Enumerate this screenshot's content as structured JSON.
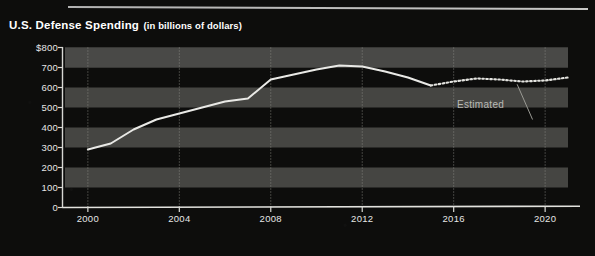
{
  "header": {
    "title_main": "U.S. Defense Spending",
    "title_sub": "(in billions of dollars)"
  },
  "annotations": {
    "estimated_label": "Estimated"
  },
  "colors": {
    "background": "#0d0d0c",
    "band": "#4a4a48",
    "line": "#e9e9e6",
    "axis": "#d8d8d4",
    "gridline": "#8e8e88",
    "text": "#ffffff"
  },
  "chart_data": {
    "type": "line",
    "title": "U.S. Defense Spending (in billions of dollars)",
    "xlabel": "",
    "ylabel": "billions of dollars",
    "xlim": [
      1999,
      2021
    ],
    "ylim": [
      0,
      800
    ],
    "yticks": [
      0,
      100,
      200,
      300,
      400,
      500,
      600,
      700,
      800
    ],
    "ytick_labels": [
      "0",
      "100",
      "200",
      "300",
      "400",
      "500",
      "600",
      "700",
      "$800"
    ],
    "xticks": [
      2000,
      2004,
      2008,
      2012,
      2016,
      2020
    ],
    "xtick_labels": [
      "2000",
      "2004",
      "2008",
      "2012",
      "2016",
      "2020"
    ],
    "grid": "horizontal-bands-and-vertical-dotted",
    "legend": "none",
    "series": [
      {
        "name": "Actual",
        "style": "solid",
        "x": [
          2000,
          2001,
          2002,
          2003,
          2004,
          2005,
          2006,
          2007,
          2008,
          2009,
          2010,
          2011,
          2012,
          2013,
          2014,
          2015
        ],
        "values": [
          290,
          320,
          390,
          440,
          470,
          500,
          530,
          545,
          640,
          665,
          690,
          710,
          705,
          680,
          650,
          610
        ]
      },
      {
        "name": "Estimated",
        "style": "dotted",
        "x": [
          2015,
          2016,
          2017,
          2018,
          2019,
          2020,
          2021
        ],
        "values": [
          610,
          630,
          645,
          640,
          630,
          635,
          650
        ]
      }
    ],
    "annotations": [
      {
        "text": "Estimated",
        "x": 2017,
        "y": 430,
        "leader_to": {
          "x": 2018.6,
          "y": 636
        }
      }
    ]
  }
}
